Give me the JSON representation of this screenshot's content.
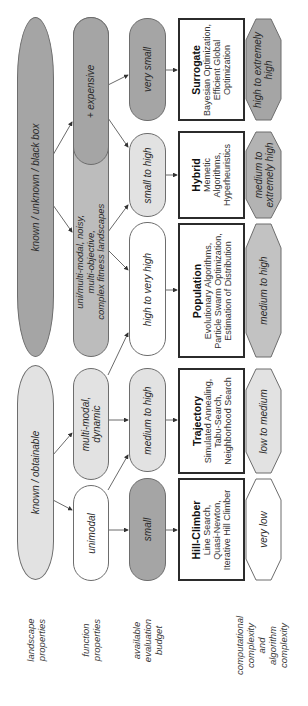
{
  "row_labels": {
    "landscape": [
      "landscape",
      "properties"
    ],
    "function": [
      "function",
      "properties"
    ],
    "budget": [
      "available",
      "evaluation",
      "budget"
    ],
    "complexity": [
      "computational",
      "complexity",
      "and",
      "algorithm",
      "complexity"
    ]
  },
  "landscape": {
    "black_box": "known / unknown / black box",
    "obtainable": "known / obtainable"
  },
  "function": {
    "expensive": "+ expensive",
    "complex": [
      "uni/multi-modal, noisy,",
      "multi-objective,",
      "complex fitness landscapes"
    ],
    "multimodal": [
      "multi-modal,",
      "dynamic"
    ],
    "unimodal": "unimodal"
  },
  "budget": {
    "very_small": "very small",
    "small_to_high": "small to high",
    "high_to_very_high": "high to very high",
    "medium_to_high": "medium to high",
    "small": "small"
  },
  "algorithms": {
    "surrogate": {
      "title": "Surrogate",
      "lines": [
        "Bayesian Optimization,",
        "Efficient Global",
        "Optimization"
      ]
    },
    "hybrid": {
      "title": "Hybrid",
      "lines": [
        "Memetic",
        "Algorithms,",
        "Hyperheuristics"
      ]
    },
    "population": {
      "title": "Population",
      "lines": [
        "Evolutionary Algorithms,",
        "Particle Swarm Optimization,",
        "Estimation of Distribution"
      ]
    },
    "trajectory": {
      "title": "Trajectory",
      "lines": [
        "Simulated Annealing,",
        "Tabu-Search,",
        "Neighborhood Search"
      ]
    },
    "hillclimber": {
      "title": "Hill-Climber",
      "lines": [
        "Line Search,",
        "Quasi-Newton,",
        "Iterative Hill Climber"
      ]
    }
  },
  "complexity": {
    "surrogate": [
      "high to extremely",
      "high"
    ],
    "hybrid": [
      "medium to",
      "extremely high"
    ],
    "population": [
      "medium to high"
    ],
    "trajectory": [
      "low to medium"
    ],
    "hillclimber": [
      "very low"
    ]
  },
  "colors": {
    "dark": "#a5a5a5",
    "mid": "#bcbcbc",
    "light": "#e2e2e2",
    "white": "#ffffff",
    "border": "#2b2b2b"
  }
}
